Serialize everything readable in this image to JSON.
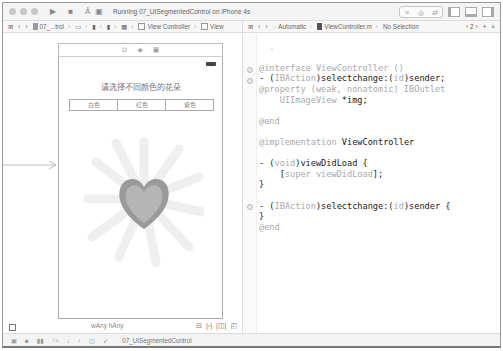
{
  "window": {
    "run_status": "Running 07_UISegmentedControl on iPhone 4s"
  },
  "toolbar": {
    "run_icon": "play-icon",
    "stop_icon": "stop-icon",
    "scheme_icon": "scheme-icon",
    "device_icon": "device-icon",
    "editor_modes": [
      "standard-editor-icon",
      "assistant-editor-icon",
      "version-editor-icon"
    ],
    "panels": [
      "navigator-toggle-icon",
      "debug-area-toggle-icon",
      "utilities-toggle-icon"
    ]
  },
  "left_jumpbar": {
    "items": [
      "07_...trol",
      "View Controller",
      "View"
    ]
  },
  "right_jumpbar": {
    "mode": "Automatic",
    "file": "ViewController.m",
    "selection": "No Selection",
    "counter": "2"
  },
  "storyboard": {
    "prompt": "请选择不同颜色的花朵",
    "segments": [
      "白色",
      "红色",
      "紫色"
    ],
    "selected_segment": 0,
    "image_desc": "heart-shaped daisy flower"
  },
  "size_bar": {
    "size_class": "wAny hAny"
  },
  "debug_bar": {
    "target": "07_UISegmentedControl"
  },
  "code": {
    "lines": [
      "@interface ViewController ()",
      "- (IBAction)selectchange:(id)sender;",
      "@property (weak, nonatomic) IBOutlet",
      "    UIImageView *img;",
      "",
      "@end",
      "",
      "@implementation ViewController",
      "",
      "- (void)viewDidLoad {",
      "    [super viewDidLoad];",
      "}",
      "",
      "- (IBAction)selectchange:(id)sender {",
      "}",
      "@end"
    ]
  }
}
